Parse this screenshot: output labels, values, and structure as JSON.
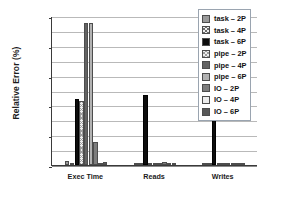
{
  "chart_data": {
    "type": "bar",
    "title": "",
    "xlabel": "",
    "ylabel": "Relative Error (%)",
    "ylim": [
      0,
      2.0
    ],
    "ytick_labels": [
      "0.00%",
      "0.20%",
      "0.40%",
      "0.60%",
      "0.80%",
      "1.00%",
      "1.20%",
      "1.40%",
      "1.60%",
      "1.80%",
      "2.00%"
    ],
    "ytick_values": [
      0,
      0.2,
      0.4,
      0.6,
      0.8,
      1.0,
      1.2,
      1.4,
      1.6,
      1.8,
      2.0
    ],
    "grid": true,
    "legend_position": "upper right",
    "categories": [
      "Exec Time",
      "Reads",
      "Writes"
    ],
    "series": [
      {
        "name": "task – 2P",
        "values": [
          0.06,
          0.01,
          0.0
        ]
      },
      {
        "name": "task – 4P",
        "values": [
          0.02,
          0.0,
          0.0
        ]
      },
      {
        "name": "task – 6P",
        "values": [
          0.89,
          0.94,
          0.68
        ]
      },
      {
        "name": "pipe – 2P",
        "values": [
          0.86,
          0.01,
          0.0
        ]
      },
      {
        "name": "pipe – 4P",
        "values": [
          1.91,
          0.0,
          0.0
        ]
      },
      {
        "name": "pipe – 6P",
        "values": [
          1.9,
          0.0,
          0.0
        ]
      },
      {
        "name": "IO – 2P",
        "values": [
          0.31,
          0.04,
          0.0
        ]
      },
      {
        "name": "IO – 4P",
        "values": [
          0.02,
          0.03,
          0.0
        ]
      },
      {
        "name": "IO – 6P",
        "values": [
          0.04,
          0.01,
          0.01
        ]
      }
    ],
    "series_colors": [
      "#9a9a9a",
      "#f0f0f0",
      "#0d0d0d",
      "#efefef",
      "#636363",
      "#b2b2b2",
      "#7d7d7d",
      "#ededed",
      "#585858"
    ]
  },
  "legend": {
    "entries": [
      {
        "label": "task – 2P"
      },
      {
        "label": "task – 4P"
      },
      {
        "label": "task – 6P"
      },
      {
        "label": "pipe – 2P"
      },
      {
        "label": "pipe – 4P"
      },
      {
        "label": "pipe – 6P"
      },
      {
        "label": "IO – 2P"
      },
      {
        "label": "IO – 4P"
      },
      {
        "label": "IO – 6P"
      }
    ]
  }
}
